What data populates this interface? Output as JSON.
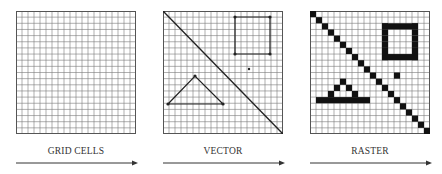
{
  "panels": [
    {
      "id": "grid",
      "label": "GRID CELLS",
      "x": 16
    },
    {
      "id": "vector",
      "label": "VECTOR",
      "x": 163
    },
    {
      "id": "raster",
      "label": "RASTER",
      "x": 310
    }
  ],
  "grid": {
    "cols": 20,
    "rows": 20,
    "line_color": "#7a7a7a",
    "border_color": "#555555"
  },
  "vector": {
    "diagonal": [
      [
        0,
        0
      ],
      [
        120,
        123
      ]
    ],
    "square": [
      [
        72,
        6
      ],
      [
        107,
        6
      ],
      [
        107,
        43
      ],
      [
        72,
        43
      ]
    ],
    "point": [
      86,
      58
    ],
    "triangle": [
      [
        5,
        93
      ],
      [
        32,
        65
      ],
      [
        60,
        93
      ]
    ]
  },
  "raster": {
    "fill": "#111111",
    "diagonal": true,
    "square": {
      "c0": 12,
      "r0": 2,
      "c1": 17,
      "r1": 7
    },
    "point": [
      14,
      10
    ],
    "triangle": [
      [
        5,
        11
      ],
      [
        4,
        12
      ],
      [
        6,
        12
      ],
      [
        3,
        13
      ],
      [
        7,
        13
      ],
      [
        1,
        14
      ],
      [
        2,
        14
      ],
      [
        3,
        14
      ],
      [
        4,
        14
      ],
      [
        5,
        14
      ],
      [
        6,
        14
      ],
      [
        7,
        14
      ],
      [
        8,
        14
      ],
      [
        9,
        14
      ]
    ]
  },
  "colors": {
    "line": "#222222",
    "arrow": "#333333",
    "text": "#333333"
  }
}
